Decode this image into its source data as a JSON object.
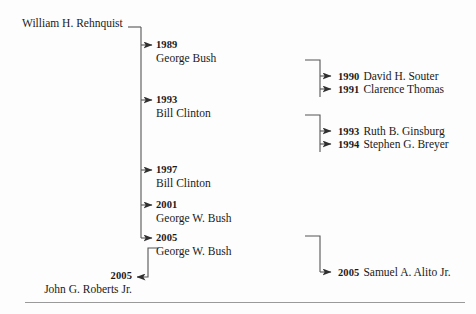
{
  "diagram": {
    "root": {
      "label": "William H. Rehnquist"
    },
    "colors": {
      "background": "#fdfdfd",
      "line": "#555555",
      "text": "#1a1a1a",
      "rule": "#9a9a9a"
    },
    "spine_entries": [
      {
        "year": "1989",
        "name": "George Bush"
      },
      {
        "year": "1993",
        "name": "Bill Clinton"
      },
      {
        "year": "1997",
        "name": "Bill Clinton"
      },
      {
        "year": "2001",
        "name": "George W. Bush"
      },
      {
        "year": "2005",
        "name": "George W. Bush"
      }
    ],
    "branch_entries": [
      {
        "year": "1990",
        "name": "David H. Souter"
      },
      {
        "year": "1991",
        "name": "Clarence Thomas"
      },
      {
        "year": "1993",
        "name": "Ruth B. Ginsburg"
      },
      {
        "year": "1994",
        "name": "Stephen G. Breyer"
      },
      {
        "year": "2005",
        "name": "Samuel A. Alito Jr."
      }
    ],
    "terminal": {
      "year": "2005",
      "name": "John G. Roberts Jr."
    }
  }
}
